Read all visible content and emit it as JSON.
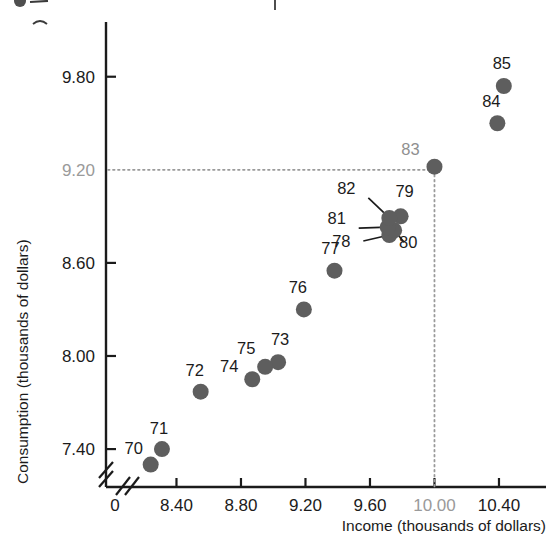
{
  "chart_data": {
    "type": "scatter",
    "title": "",
    "xlabel": "Income (thousands of dollars)",
    "ylabel": "Consumption (thousands of dollars)",
    "xlim": [
      8.18,
      10.58
    ],
    "ylim": [
      7.22,
      9.94
    ],
    "grid": false,
    "legend": "none",
    "axis_break_x": true,
    "axis_break_y": true,
    "x_ticks": [
      {
        "value": 0,
        "label": "0",
        "highlight": false
      },
      {
        "value": 8.4,
        "label": "8.40",
        "highlight": false
      },
      {
        "value": 8.8,
        "label": "8.80",
        "highlight": false
      },
      {
        "value": 9.2,
        "label": "9.20",
        "highlight": false
      },
      {
        "value": 9.6,
        "label": "9.60",
        "highlight": false
      },
      {
        "value": 10.0,
        "label": "10.00",
        "highlight": true
      },
      {
        "value": 10.4,
        "label": "10.40",
        "highlight": false
      }
    ],
    "y_ticks": [
      {
        "value": 7.4,
        "label": "7.40",
        "highlight": false
      },
      {
        "value": 8.0,
        "label": "8.00",
        "highlight": false
      },
      {
        "value": 8.6,
        "label": "8.60",
        "highlight": false
      },
      {
        "value": 9.2,
        "label": "9.20",
        "highlight": true
      },
      {
        "value": 9.8,
        "label": "9.80",
        "highlight": false
      }
    ],
    "guides": {
      "x": 10.0,
      "y": 9.2,
      "note": "dotted guide lines from y-axis 9.20 and x-axis 10.00 meeting at point 83"
    },
    "points": [
      {
        "label": "70",
        "x": 8.24,
        "y": 7.3,
        "label_dx": -17,
        "label_dy": -11,
        "leader": false
      },
      {
        "label": "71",
        "x": 8.31,
        "y": 7.4,
        "label_dx": -3,
        "label_dy": -15,
        "leader": false
      },
      {
        "label": "72",
        "x": 8.55,
        "y": 7.77,
        "label_dx": -6,
        "label_dy": -16,
        "leader": false
      },
      {
        "label": "73",
        "x": 9.03,
        "y": 7.96,
        "label_dx": 2,
        "label_dy": -17,
        "leader": false
      },
      {
        "label": "74",
        "x": 8.87,
        "y": 7.85,
        "label_dx": -23,
        "label_dy": -7,
        "leader": false
      },
      {
        "label": "75",
        "x": 8.95,
        "y": 7.93,
        "label_dx": -19,
        "label_dy": -13,
        "leader": false
      },
      {
        "label": "76",
        "x": 9.19,
        "y": 8.3,
        "label_dx": -6,
        "label_dy": -16,
        "leader": false
      },
      {
        "label": "77",
        "x": 9.38,
        "y": 8.55,
        "label_dx": -4,
        "label_dy": -17,
        "leader": false
      },
      {
        "label": "78",
        "x": 9.72,
        "y": 8.78,
        "label_dx": -48,
        "label_dy": 12,
        "leader": true
      },
      {
        "label": "79",
        "x": 9.79,
        "y": 8.9,
        "label_dx": 4,
        "label_dy": -19,
        "leader": false
      },
      {
        "label": "80",
        "x": 9.75,
        "y": 8.81,
        "label_dx": 14,
        "label_dy": 18,
        "leader": true
      },
      {
        "label": "81",
        "x": 9.71,
        "y": 8.83,
        "label_dx": -51,
        "label_dy": -3,
        "leader": true
      },
      {
        "label": "82",
        "x": 9.72,
        "y": 8.89,
        "label_dx": -43,
        "label_dy": -24,
        "leader": true
      },
      {
        "label": "83",
        "x": 10.0,
        "y": 9.22,
        "label_dx": -24,
        "label_dy": -12,
        "leader": false,
        "highlight": true
      },
      {
        "label": "84",
        "x": 10.39,
        "y": 9.5,
        "label_dx": -6,
        "label_dy": -16,
        "leader": false
      },
      {
        "label": "85",
        "x": 10.43,
        "y": 9.74,
        "label_dx": -2,
        "label_dy": -17,
        "leader": false
      }
    ],
    "colors": {
      "marker": "#5e5e5e",
      "axis": "#1b1b1b",
      "text": "#1b1b1b",
      "highlight": "#9a9a9a",
      "background": "#ffffff"
    }
  }
}
